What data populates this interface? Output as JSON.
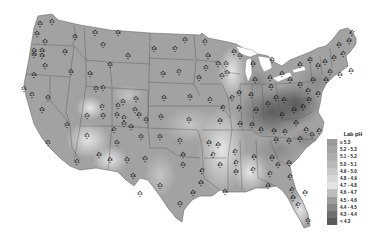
{
  "map": {
    "title": "Lab pH",
    "region": "Contiguous United States",
    "ocean_color": "#ffffff",
    "border_color": "#555555"
  },
  "legend": {
    "title": "Lab pH",
    "items": [
      {
        "label": "≥ 5.3",
        "color": "#9a9a9a"
      },
      {
        "label": "5.2 - 5.3",
        "color": "#a4a4a4"
      },
      {
        "label": "5.1 - 5.2",
        "color": "#aeaeae"
      },
      {
        "label": "5.0 - 5.1",
        "color": "#b9b9b9"
      },
      {
        "label": "4.9 - 5.0",
        "color": "#c8c8c8"
      },
      {
        "label": "4.8 - 4.9",
        "color": "#d6d6d6"
      },
      {
        "label": "4.7 - 4.8",
        "color": "#e3e3e3"
      },
      {
        "label": "4.6 - 4.7",
        "color": "#bdbdbd"
      },
      {
        "label": "4.5 - 4.6",
        "color": "#9c9c9c"
      },
      {
        "label": "4.4 - 4.5",
        "color": "#878787"
      },
      {
        "label": "4.3 - 4.4",
        "color": "#707070"
      },
      {
        "label": "< 4.3",
        "color": "#5a5a5a"
      }
    ]
  },
  "stations": [
    {
      "x": 40,
      "y": 24,
      "v": "5.5"
    },
    {
      "x": 52,
      "y": 22,
      "v": "5.1"
    },
    {
      "x": 37,
      "y": 34,
      "v": "5.6"
    },
    {
      "x": 45,
      "y": 42,
      "v": "5.3"
    },
    {
      "x": 34,
      "y": 51,
      "v": "5.4"
    },
    {
      "x": 42,
      "y": 51,
      "v": "5.4"
    },
    {
      "x": 34,
      "y": 55,
      "v": "5.4"
    },
    {
      "x": 42,
      "y": 56,
      "v": "5.4"
    },
    {
      "x": 45,
      "y": 66,
      "v": "5.3"
    },
    {
      "x": 34,
      "y": 75,
      "v": "5.6"
    },
    {
      "x": 65,
      "y": 52,
      "v": "5.4"
    },
    {
      "x": 75,
      "y": 37,
      "v": "5.5"
    },
    {
      "x": 71,
      "y": 72,
      "v": "5.6"
    },
    {
      "x": 90,
      "y": 74,
      "v": "5.4"
    },
    {
      "x": 95,
      "y": 33,
      "v": "5.3"
    },
    {
      "x": 118,
      "y": 33,
      "v": "5.4"
    },
    {
      "x": 103,
      "y": 45,
      "v": "5.3"
    },
    {
      "x": 128,
      "y": 56,
      "v": "5.5"
    },
    {
      "x": 110,
      "y": 65,
      "v": "5.3"
    },
    {
      "x": 24,
      "y": 89,
      "v": "5.6"
    },
    {
      "x": 32,
      "y": 95,
      "v": "5.1"
    },
    {
      "x": 42,
      "y": 110,
      "v": "5.6"
    },
    {
      "x": 48,
      "y": 98,
      "v": "5.5"
    },
    {
      "x": 96,
      "y": 89,
      "v": "5.3"
    },
    {
      "x": 103,
      "y": 88,
      "v": "5.1"
    },
    {
      "x": 67,
      "y": 125,
      "v": "5.6"
    },
    {
      "x": 48,
      "y": 143,
      "v": "5.1"
    },
    {
      "x": 77,
      "y": 162,
      "v": "5.1"
    },
    {
      "x": 87,
      "y": 116,
      "v": "5.0"
    },
    {
      "x": 102,
      "y": 107,
      "v": "5.7"
    },
    {
      "x": 103,
      "y": 116,
      "v": "5.3"
    },
    {
      "x": 118,
      "y": 106,
      "v": "5.1"
    },
    {
      "x": 123,
      "y": 102,
      "v": "5.0"
    },
    {
      "x": 136,
      "y": 99,
      "v": "5.6"
    },
    {
      "x": 117,
      "y": 115,
      "v": "5.0"
    },
    {
      "x": 124,
      "y": 118,
      "v": "5.1"
    },
    {
      "x": 135,
      "y": 110,
      "v": "5.0"
    },
    {
      "x": 139,
      "y": 115,
      "v": "4.9"
    },
    {
      "x": 124,
      "y": 124,
      "v": "5.3"
    },
    {
      "x": 131,
      "y": 127,
      "v": "5.4"
    },
    {
      "x": 146,
      "y": 120,
      "v": "5.5"
    },
    {
      "x": 114,
      "y": 130,
      "v": "4.7"
    },
    {
      "x": 87,
      "y": 136,
      "v": "5.1"
    },
    {
      "x": 99,
      "y": 155,
      "v": "4.9"
    },
    {
      "x": 110,
      "y": 160,
      "v": "4.8"
    },
    {
      "x": 117,
      "y": 143,
      "v": "5.0"
    },
    {
      "x": 127,
      "y": 160,
      "v": "5.2"
    },
    {
      "x": 141,
      "y": 137,
      "v": "5.5"
    },
    {
      "x": 145,
      "y": 159,
      "v": "5.3"
    },
    {
      "x": 133,
      "y": 176,
      "v": "5.4"
    },
    {
      "x": 160,
      "y": 137,
      "v": "5.6"
    },
    {
      "x": 160,
      "y": 186,
      "v": "5.3"
    },
    {
      "x": 140,
      "y": 194,
      "v": "5.5"
    },
    {
      "x": 180,
      "y": 204,
      "v": "5.2"
    },
    {
      "x": 161,
      "y": 117,
      "v": "5.6"
    },
    {
      "x": 164,
      "y": 98,
      "v": "5.6"
    },
    {
      "x": 163,
      "y": 74,
      "v": "5.4"
    },
    {
      "x": 179,
      "y": 72,
      "v": "5.7"
    },
    {
      "x": 154,
      "y": 49,
      "v": "5.4"
    },
    {
      "x": 175,
      "y": 49,
      "v": "5.7"
    },
    {
      "x": 185,
      "y": 40,
      "v": "5.5"
    },
    {
      "x": 190,
      "y": 97,
      "v": "5.6"
    },
    {
      "x": 189,
      "y": 120,
      "v": "5.0"
    },
    {
      "x": 180,
      "y": 141,
      "v": "5.1"
    },
    {
      "x": 183,
      "y": 155,
      "v": "4.9"
    },
    {
      "x": 183,
      "y": 165,
      "v": "5.0"
    },
    {
      "x": 199,
      "y": 78,
      "v": "5.6"
    },
    {
      "x": 210,
      "y": 100,
      "v": "5.1"
    },
    {
      "x": 220,
      "y": 121,
      "v": "4.8"
    },
    {
      "x": 209,
      "y": 143,
      "v": "4.8"
    },
    {
      "x": 218,
      "y": 145,
      "v": "4.9"
    },
    {
      "x": 202,
      "y": 171,
      "v": "4.7"
    },
    {
      "x": 201,
      "y": 183,
      "v": "4.8"
    },
    {
      "x": 193,
      "y": 193,
      "v": "4.8"
    },
    {
      "x": 213,
      "y": 155,
      "v": "4.7"
    },
    {
      "x": 220,
      "y": 165,
      "v": "4.9"
    },
    {
      "x": 225,
      "y": 192,
      "v": "4.8"
    },
    {
      "x": 235,
      "y": 152,
      "v": "4.7"
    },
    {
      "x": 236,
      "y": 163,
      "v": "4.7"
    },
    {
      "x": 236,
      "y": 172,
      "v": "4.8"
    },
    {
      "x": 254,
      "y": 157,
      "v": "4.6"
    },
    {
      "x": 253,
      "y": 170,
      "v": "4.7"
    },
    {
      "x": 272,
      "y": 158,
      "v": "4.8"
    },
    {
      "x": 270,
      "y": 174,
      "v": "4.7"
    },
    {
      "x": 278,
      "y": 165,
      "v": "4.6"
    },
    {
      "x": 289,
      "y": 163,
      "v": "4.8"
    },
    {
      "x": 290,
      "y": 177,
      "v": "4.7"
    },
    {
      "x": 268,
      "y": 186,
      "v": "4.8"
    },
    {
      "x": 292,
      "y": 190,
      "v": "4.7"
    },
    {
      "x": 293,
      "y": 198,
      "v": "4.8"
    },
    {
      "x": 298,
      "y": 205,
      "v": "4.7"
    },
    {
      "x": 305,
      "y": 193,
      "v": "4.8"
    },
    {
      "x": 308,
      "y": 221,
      "v": "5.0"
    },
    {
      "x": 232,
      "y": 98,
      "v": "4.7"
    },
    {
      "x": 223,
      "y": 108,
      "v": "4.7"
    },
    {
      "x": 239,
      "y": 93,
      "v": "4.8"
    },
    {
      "x": 239,
      "y": 108,
      "v": "4.4"
    },
    {
      "x": 251,
      "y": 95,
      "v": "4.5"
    },
    {
      "x": 256,
      "y": 110,
      "v": "4.4"
    },
    {
      "x": 240,
      "y": 124,
      "v": "4.4"
    },
    {
      "x": 252,
      "y": 125,
      "v": "4.5"
    },
    {
      "x": 261,
      "y": 130,
      "v": "4.5"
    },
    {
      "x": 268,
      "y": 104,
      "v": "4.3"
    },
    {
      "x": 276,
      "y": 98,
      "v": "4.3"
    },
    {
      "x": 284,
      "y": 100,
      "v": "4.2"
    },
    {
      "x": 282,
      "y": 115,
      "v": "4.2"
    },
    {
      "x": 294,
      "y": 110,
      "v": "4.4"
    },
    {
      "x": 303,
      "y": 107,
      "v": "4.3"
    },
    {
      "x": 309,
      "y": 100,
      "v": "4.2"
    },
    {
      "x": 296,
      "y": 123,
      "v": "4.5"
    },
    {
      "x": 306,
      "y": 130,
      "v": "4.5"
    },
    {
      "x": 312,
      "y": 135,
      "v": "5.0"
    },
    {
      "x": 319,
      "y": 131,
      "v": "4.7"
    },
    {
      "x": 274,
      "y": 131,
      "v": "4.4"
    },
    {
      "x": 276,
      "y": 140,
      "v": "4.4"
    },
    {
      "x": 285,
      "y": 132,
      "v": "4.5"
    },
    {
      "x": 289,
      "y": 141,
      "v": "4.6"
    },
    {
      "x": 300,
      "y": 139,
      "v": "4.5"
    },
    {
      "x": 270,
      "y": 78,
      "v": "4.6"
    },
    {
      "x": 255,
      "y": 80,
      "v": "4.5"
    },
    {
      "x": 271,
      "y": 87,
      "v": "4.5"
    },
    {
      "x": 253,
      "y": 64,
      "v": "4.6"
    },
    {
      "x": 272,
      "y": 60,
      "v": "4.5"
    },
    {
      "x": 282,
      "y": 74,
      "v": "4.5"
    },
    {
      "x": 290,
      "y": 80,
      "v": "4.4"
    },
    {
      "x": 300,
      "y": 85,
      "v": "4.3"
    },
    {
      "x": 308,
      "y": 91,
      "v": "4.3"
    },
    {
      "x": 313,
      "y": 80,
      "v": "4.4"
    },
    {
      "x": 318,
      "y": 94,
      "v": "4.5"
    },
    {
      "x": 300,
      "y": 65,
      "v": "4.5"
    },
    {
      "x": 310,
      "y": 60,
      "v": "4.5"
    },
    {
      "x": 318,
      "y": 66,
      "v": "4.4"
    },
    {
      "x": 325,
      "y": 62,
      "v": "4.6"
    },
    {
      "x": 334,
      "y": 58,
      "v": "4.5"
    },
    {
      "x": 330,
      "y": 72,
      "v": "4.5"
    },
    {
      "x": 326,
      "y": 80,
      "v": "4.4"
    },
    {
      "x": 340,
      "y": 75,
      "v": "4.6"
    },
    {
      "x": 351,
      "y": 71,
      "v": "4.6"
    },
    {
      "x": 343,
      "y": 54,
      "v": "4.7"
    },
    {
      "x": 339,
      "y": 45,
      "v": "4.6"
    },
    {
      "x": 352,
      "y": 33,
      "v": "4.7"
    },
    {
      "x": 349,
      "y": 41,
      "v": "4.8"
    },
    {
      "x": 205,
      "y": 42,
      "v": "5.1"
    },
    {
      "x": 208,
      "y": 56,
      "v": "5.4"
    },
    {
      "x": 218,
      "y": 64,
      "v": "5.3"
    },
    {
      "x": 226,
      "y": 64,
      "v": "5.0"
    },
    {
      "x": 234,
      "y": 52,
      "v": "4.9"
    },
    {
      "x": 240,
      "y": 56,
      "v": "5.0"
    },
    {
      "x": 222,
      "y": 76,
      "v": "5.0"
    },
    {
      "x": 206,
      "y": 68,
      "v": "5.1"
    },
    {
      "x": 227,
      "y": 73,
      "v": "5.3"
    }
  ],
  "shading_zones": [
    {
      "name": "west-base",
      "color": "#a0a0a0"
    },
    {
      "name": "plains-light",
      "color": "#c6c6c6"
    },
    {
      "name": "southwest-light",
      "color": "#d9d9d9"
    },
    {
      "name": "mississippi-light",
      "color": "#e0e0e0"
    },
    {
      "name": "ohio-dark",
      "color": "#6e6e6e"
    },
    {
      "name": "northeast-dark",
      "color": "#7c7c7c"
    },
    {
      "name": "southeast-mid",
      "color": "#bcbcbc"
    }
  ]
}
